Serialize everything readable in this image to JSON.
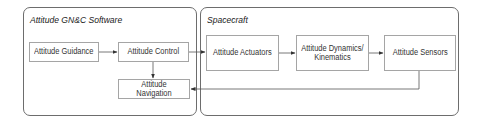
{
  "diagram": {
    "panels": [
      {
        "id": "software",
        "title": "Attitude GN&C Software"
      },
      {
        "id": "spacecraft",
        "title": "Spacecraft"
      }
    ],
    "blocks": {
      "guidance": "Attitude Guidance",
      "control": "Attitude Control",
      "navigation": "Attitude Navigation",
      "actuators": "Attitude Actuators",
      "dynamics": "Attitude Dynamics/\nKinematics",
      "sensors": "Attitude Sensors"
    },
    "connections": [
      {
        "from": "Attitude Guidance",
        "to": "Attitude Control"
      },
      {
        "from": "Attitude Control",
        "to": "Attitude Navigation"
      },
      {
        "from": "Attitude Control",
        "to": "Attitude Actuators"
      },
      {
        "from": "Attitude Actuators",
        "to": "Attitude Dynamics/Kinematics"
      },
      {
        "from": "Attitude Dynamics/Kinematics",
        "to": "Attitude Sensors"
      },
      {
        "from": "Attitude Sensors",
        "to": "Attitude Navigation"
      }
    ],
    "colors": {
      "panel_border": "#6d6d6d",
      "block_border": "#a5a5a5",
      "wire": "#555555"
    }
  }
}
